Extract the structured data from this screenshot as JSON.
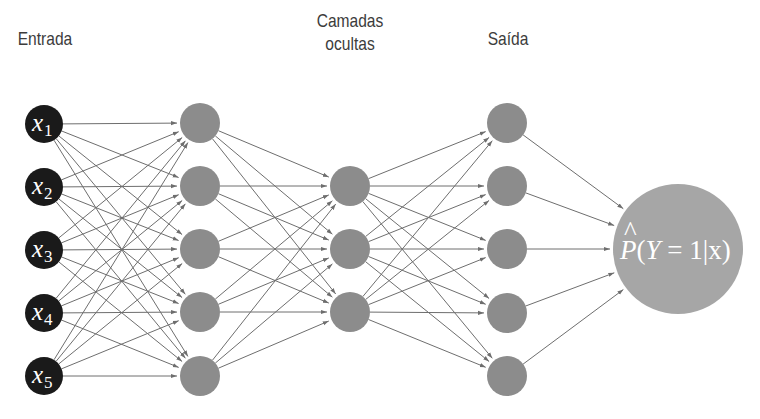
{
  "labels": {
    "input": "Entrada",
    "hidden_line1": "Camadas",
    "hidden_line2": "ocultas",
    "output": "Saída"
  },
  "colors": {
    "input_node": "#1a1a1a",
    "hidden_node": "#8c8c8c",
    "output_circle": "#a6a6a6",
    "edge": "#6e6e6e",
    "label_text": "#3c3c3c"
  },
  "input_nodes": [
    {
      "var": "x",
      "sub": "1"
    },
    {
      "var": "x",
      "sub": "2"
    },
    {
      "var": "x",
      "sub": "3"
    },
    {
      "var": "x",
      "sub": "4"
    },
    {
      "var": "x",
      "sub": "5"
    }
  ],
  "layers": {
    "input": {
      "cx": 44,
      "ys": [
        124,
        187,
        250,
        313,
        376
      ],
      "r": 19
    },
    "hidden1": {
      "cx": 200,
      "ys": [
        123,
        186,
        249,
        312,
        376
      ],
      "r": 20
    },
    "hidden2": {
      "cx": 350,
      "ys": [
        186,
        249,
        312
      ],
      "r": 20
    },
    "output": {
      "cx": 507,
      "ys": [
        123,
        186,
        249,
        313,
        376
      ],
      "r": 20
    },
    "final": {
      "cx": 678,
      "cy": 249,
      "r": 65
    }
  },
  "final_output": {
    "hat": "^",
    "p": "P",
    "rest_open": "(",
    "y": "Y",
    "eq": " = 1|x)"
  }
}
